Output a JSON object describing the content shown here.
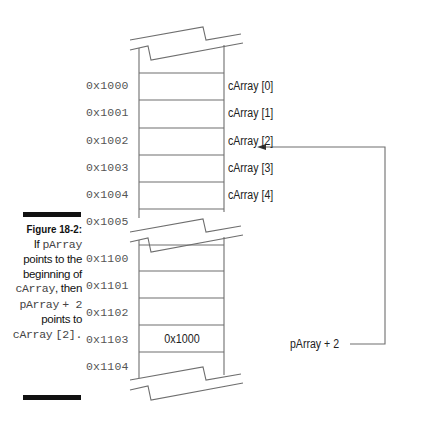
{
  "figure": {
    "label": "Figure 18-2:",
    "caption_parts": [
      {
        "text": "If ",
        "mono": false
      },
      {
        "text": "pArray",
        "mono": true
      },
      {
        "text": " points to the beginning of ",
        "mono": false
      },
      {
        "text": "cArray",
        "mono": true
      },
      {
        "text": ", then ",
        "mono": false
      },
      {
        "text": "pArray",
        "mono": true
      },
      {
        "text": " + 2",
        "mono": true
      },
      {
        "text": " points to ",
        "mono": false
      },
      {
        "text": "cArray",
        "mono": true
      },
      {
        "text": " [2].",
        "mono": true
      }
    ]
  },
  "memory": {
    "upper_block": {
      "addresses": [
        "0x1000",
        "0x1001",
        "0x1002",
        "0x1003",
        "0x1004",
        "0x1005"
      ],
      "element_labels": [
        "cArray [0]",
        "cArray [1]",
        "cArray [2]",
        "cArray [3]",
        "cArray [4]"
      ]
    },
    "lower_block": {
      "addresses": [
        "0x1100",
        "0x1101",
        "0x1102",
        "0x1103",
        "0x1104"
      ],
      "cell_values": [
        "",
        "",
        "",
        "0x1000",
        ""
      ]
    }
  },
  "pointer": {
    "label": "pArray + 2",
    "points_to": "cArray [2]"
  },
  "colors": {
    "line": "#6e6e6e",
    "text": "#222222",
    "address_text": "#555555",
    "caption_bar": "#111111"
  }
}
